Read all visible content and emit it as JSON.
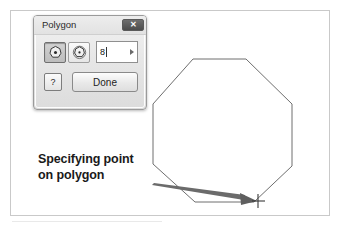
{
  "figure": {
    "border_color": "#c9c9c9",
    "background": "#ffffff"
  },
  "caption": {
    "line1": "Specifying point",
    "line2": "on polygon"
  },
  "dialog": {
    "title": "Polygon",
    "close_label": "✕",
    "tools": [
      {
        "name": "inscribed-polygon",
        "state": "pressed"
      },
      {
        "name": "circumscribed-polygon",
        "state": "normal"
      }
    ],
    "sides_input": {
      "value": "8",
      "placeholder": "8"
    },
    "spin_arrow": "▶",
    "help_label": "?",
    "done_label": "Done"
  },
  "drawing": {
    "shape": "octagon",
    "sides": 8,
    "stroke_color": "#6e6e6e",
    "arrow_color": "#5a5a5a",
    "crosshair_color": "#3a3a3a",
    "crosshair_point": {
      "x": 258,
      "y": 201
    }
  }
}
